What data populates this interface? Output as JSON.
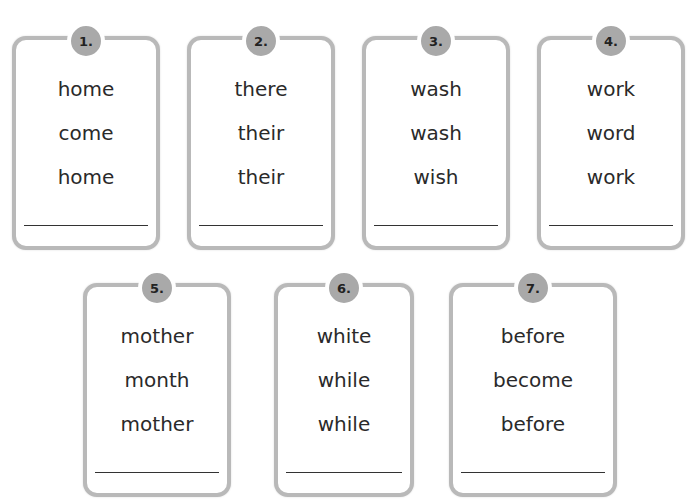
{
  "cards": [
    {
      "number": "1.",
      "words": [
        "home",
        "come",
        "home"
      ]
    },
    {
      "number": "2.",
      "words": [
        "there",
        "their",
        "their"
      ]
    },
    {
      "number": "3.",
      "words": [
        "wash",
        "wash",
        "wish"
      ]
    },
    {
      "number": "4.",
      "words": [
        "work",
        "word",
        "work"
      ]
    },
    {
      "number": "5.",
      "words": [
        "mother",
        "month",
        "mother"
      ]
    },
    {
      "number": "6.",
      "words": [
        "white",
        "while",
        "while"
      ]
    },
    {
      "number": "7.",
      "words": [
        "before",
        "become",
        "before"
      ]
    }
  ]
}
